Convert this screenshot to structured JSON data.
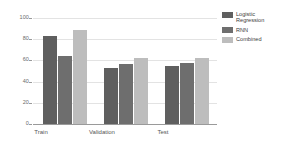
{
  "chart_data": {
    "type": "bar",
    "title": "",
    "xlabel": "",
    "ylabel": "",
    "categories": [
      "Train",
      "Validation",
      "Test"
    ],
    "series": [
      {
        "name": "Logistic Regression",
        "color": "#5f5f5f",
        "values": [
          83,
          53,
          55
        ]
      },
      {
        "name": "RNN",
        "color": "#6e6e6e",
        "values": [
          64,
          57,
          58
        ]
      },
      {
        "name": "Combined",
        "color": "#bdbdbd",
        "values": [
          89,
          62,
          62
        ]
      }
    ],
    "ylim": [
      0,
      100
    ],
    "ytick_labels": [
      "0",
      "20",
      "40",
      "60",
      "80",
      "100"
    ],
    "ytick_values": [
      0,
      20,
      40,
      60,
      80,
      100
    ],
    "grid": true,
    "legend_position": "right",
    "background_color": "#ffffff",
    "gridline_color": "#e3e3e3",
    "axis_color": "#9a9a9a"
  },
  "legend": {
    "items": [
      {
        "label": "Logistic Regression"
      },
      {
        "label": "RNN"
      },
      {
        "label": "Combined"
      }
    ]
  },
  "axes": {
    "y_ticks": [
      {
        "label": "100"
      },
      {
        "label": "80"
      },
      {
        "label": "60"
      },
      {
        "label": "40"
      },
      {
        "label": "20"
      },
      {
        "label": "0"
      }
    ],
    "x_labels": [
      {
        "label": "Train"
      },
      {
        "label": "Validation"
      },
      {
        "label": "Test"
      }
    ]
  }
}
